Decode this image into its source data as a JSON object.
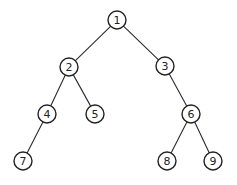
{
  "diagram": {
    "type": "binary-tree",
    "nodes": [
      {
        "id": "1",
        "label": "1",
        "x": 117,
        "y": 20
      },
      {
        "id": "2",
        "label": "2",
        "x": 69,
        "y": 67
      },
      {
        "id": "3",
        "label": "3",
        "x": 165,
        "y": 66
      },
      {
        "id": "4",
        "label": "4",
        "x": 47,
        "y": 114
      },
      {
        "id": "5",
        "label": "5",
        "x": 95,
        "y": 114
      },
      {
        "id": "6",
        "label": "6",
        "x": 191,
        "y": 114
      },
      {
        "id": "7",
        "label": "7",
        "x": 23,
        "y": 161
      },
      {
        "id": "8",
        "label": "8",
        "x": 167,
        "y": 161
      },
      {
        "id": "9",
        "label": "9",
        "x": 213,
        "y": 161
      }
    ],
    "edges": [
      {
        "from": "1",
        "to": "2"
      },
      {
        "from": "1",
        "to": "3"
      },
      {
        "from": "2",
        "to": "4"
      },
      {
        "from": "2",
        "to": "5"
      },
      {
        "from": "3",
        "to": "6"
      },
      {
        "from": "4",
        "to": "7"
      },
      {
        "from": "6",
        "to": "8"
      },
      {
        "from": "6",
        "to": "9"
      }
    ],
    "node_radius": 9,
    "colors": {
      "stroke": "#222222",
      "fill": "#ffffff",
      "background": "#ffffff"
    }
  }
}
